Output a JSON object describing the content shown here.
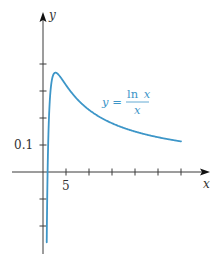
{
  "chart_data": {
    "type": "line",
    "title": "",
    "xlabel": "x",
    "ylabel": "y",
    "function": "y = ln x / x",
    "xlim": [
      0,
      36
    ],
    "ylim": [
      -0.3,
      0.59
    ],
    "x_ticks": [
      5,
      10,
      15,
      20,
      25,
      30
    ],
    "x_tick_labels": [
      {
        "value": 5,
        "label": "5"
      }
    ],
    "y_ticks": [
      -0.2,
      -0.1,
      0.1,
      0.2,
      0.3,
      0.4
    ],
    "y_tick_labels": [
      {
        "value": 0.1,
        "label": "0.1"
      }
    ],
    "grid": false,
    "legend": null,
    "series": [
      {
        "name": "y = ln x / x",
        "color": "#3d96c8",
        "x_range": [
          0.81,
          30
        ],
        "points": [
          {
            "x": 0.81,
            "y": -0.26
          },
          {
            "x": 1,
            "y": 0.0
          },
          {
            "x": 1.5,
            "y": 0.27
          },
          {
            "x": 2,
            "y": 0.347
          },
          {
            "x": 2.718,
            "y": 0.368
          },
          {
            "x": 4,
            "y": 0.347
          },
          {
            "x": 5,
            "y": 0.322
          },
          {
            "x": 7,
            "y": 0.278
          },
          {
            "x": 10,
            "y": 0.23
          },
          {
            "x": 15,
            "y": 0.181
          },
          {
            "x": 20,
            "y": 0.15
          },
          {
            "x": 25,
            "y": 0.129
          },
          {
            "x": 30,
            "y": 0.113
          }
        ]
      }
    ],
    "annotations": [
      {
        "text": "y = ln x / x",
        "lhs": "y =",
        "numerator": "ln x",
        "denominator": "x",
        "near_x": 20,
        "near_y": 0.25
      }
    ]
  },
  "labels": {
    "x_axis": "x",
    "y_axis": "y",
    "tick_5": "5",
    "tick_01": "0.1",
    "eq_lhs": "y =",
    "eq_num_fn": "ln",
    "eq_num_var": "x",
    "eq_den": "x"
  },
  "colors": {
    "axis": "#3a3a3a",
    "curve": "#3d96c8"
  }
}
